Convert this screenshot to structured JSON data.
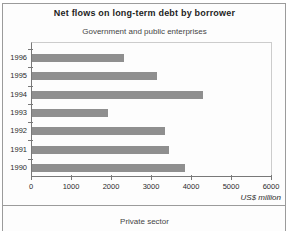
{
  "chart_data": {
    "type": "bar",
    "orientation": "horizontal",
    "title": "Net flows on long-term debt by borrower",
    "subtitle": "Government and public enterprises",
    "categories": [
      "1996",
      "1995",
      "1994",
      "1993",
      "1992",
      "1991",
      "1990"
    ],
    "values": [
      2300,
      3150,
      4300,
      1900,
      3350,
      3450,
      3850
    ],
    "xlabel": "US$ million",
    "ylabel": "",
    "xlim": [
      0,
      6000
    ],
    "x_tick_labels": [
      "0",
      "1000",
      "2000",
      "3000",
      "4000",
      "5000",
      "6000"
    ],
    "grid": false,
    "legend": "none"
  },
  "next_section": {
    "subtitle": "Private sector"
  },
  "colors": {
    "bar": "#8f8f8f",
    "axis_line": "#787878",
    "plot_border_light": "#cccccc",
    "frame_border": "#9b9b9b",
    "background": "#fdfdfd",
    "title_text": "#1e1e1e",
    "label_text": "#2b2b2b"
  }
}
